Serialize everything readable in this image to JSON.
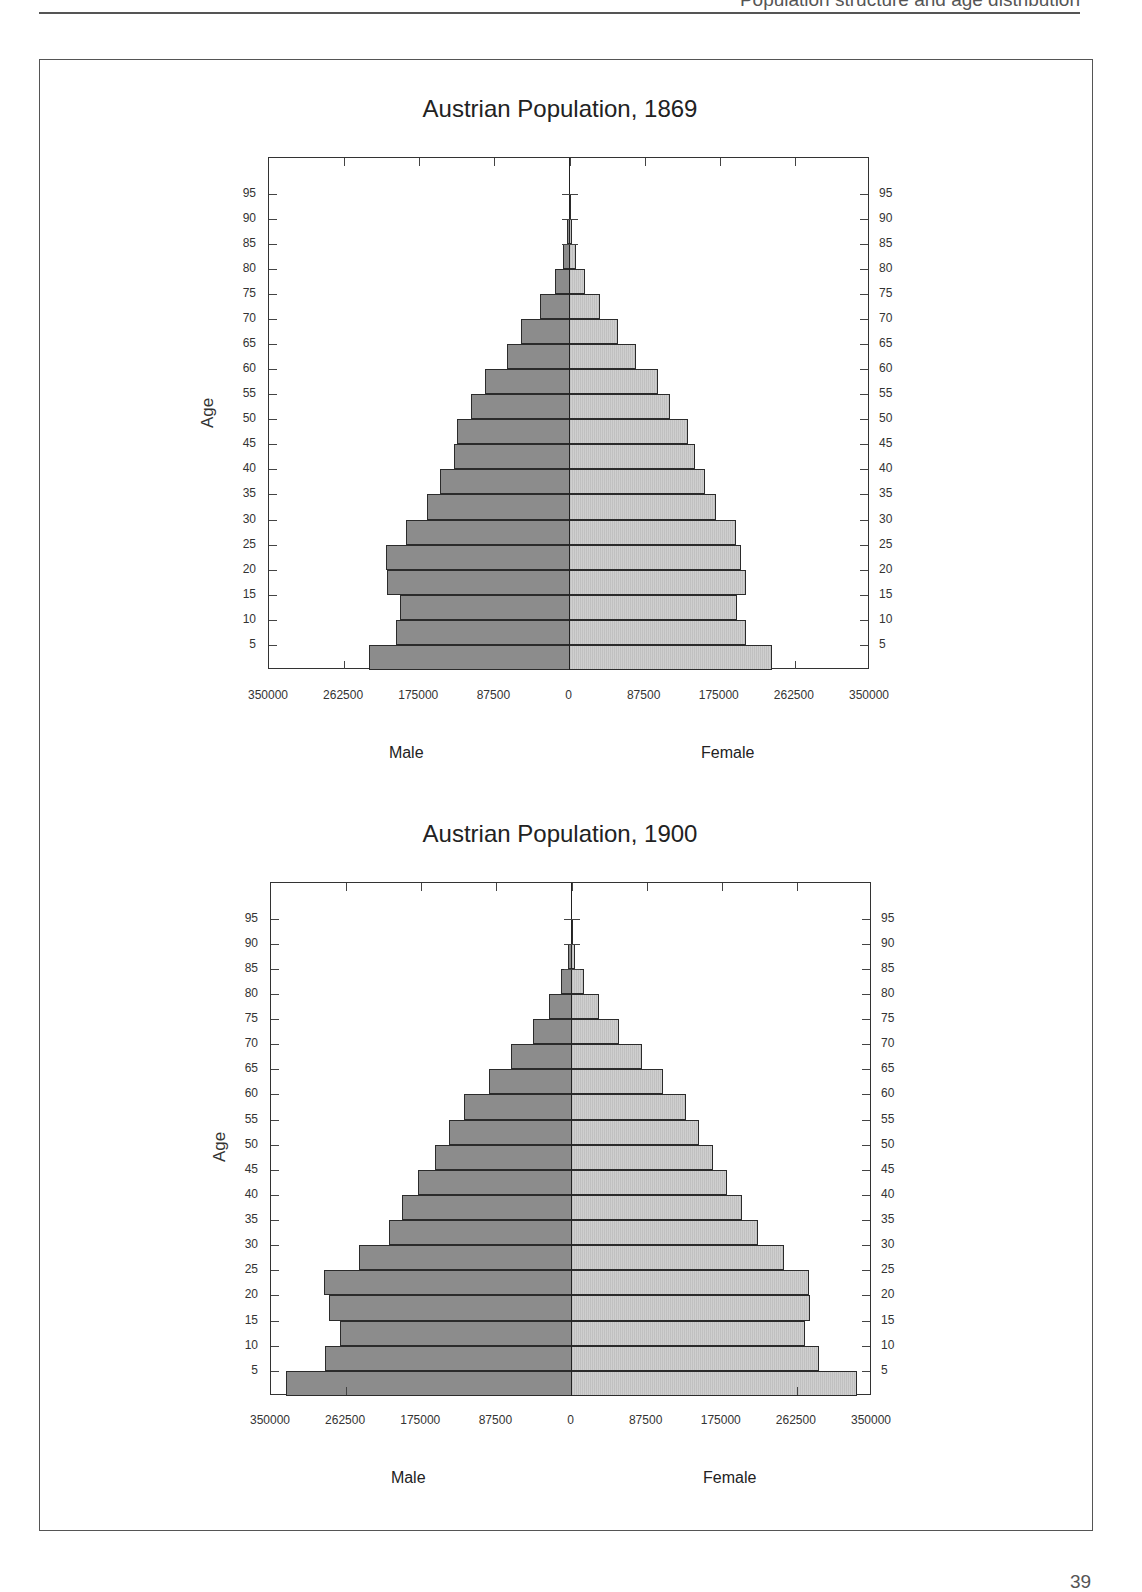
{
  "page": {
    "running_head": "Population structure and age distribution",
    "page_number": "39"
  },
  "chart_data": [
    {
      "type": "bar",
      "orientation": "horizontal",
      "subtype": "population-pyramid",
      "title": "Austrian Population, 1869",
      "ylabel": "Age",
      "xlabel_left": "Male",
      "xlabel_right": "Female",
      "xlim": [
        -350000,
        350000
      ],
      "x_ticks": [
        "350000",
        "262500",
        "175000",
        "87500",
        "0",
        "87500",
        "175000",
        "262500",
        "350000"
      ],
      "y_ticks": [
        5,
        10,
        15,
        20,
        25,
        30,
        35,
        40,
        45,
        50,
        55,
        60,
        65,
        70,
        75,
        80,
        85,
        90,
        95
      ],
      "categories": [
        "0-4",
        "5-9",
        "10-14",
        "15-19",
        "20-24",
        "25-29",
        "30-34",
        "35-39",
        "40-44",
        "45-49",
        "50-54",
        "55-59",
        "60-64",
        "65-69",
        "70-74",
        "75-79",
        "80-84",
        "85-89",
        "90-94"
      ],
      "series": [
        {
          "name": "Male",
          "values": [
            233000,
            202000,
            198000,
            213000,
            214000,
            191000,
            166000,
            151000,
            135000,
            131000,
            115000,
            99000,
            73000,
            56000,
            34000,
            17000,
            7000,
            3000,
            1000
          ]
        },
        {
          "name": "Female",
          "values": [
            236000,
            206000,
            195000,
            205000,
            200000,
            194000,
            171000,
            158000,
            146000,
            138000,
            117000,
            103000,
            78000,
            57000,
            35000,
            18000,
            7000,
            3000,
            1000
          ]
        }
      ],
      "grid": false
    },
    {
      "type": "bar",
      "orientation": "horizontal",
      "subtype": "population-pyramid",
      "title": "Austrian Population, 1900",
      "ylabel": "Age",
      "xlabel_left": "Male",
      "xlabel_right": "Female",
      "xlim": [
        -350000,
        350000
      ],
      "x_ticks": [
        "350000",
        "262500",
        "175000",
        "87500",
        "0",
        "87500",
        "175000",
        "262500",
        "350000"
      ],
      "y_ticks": [
        5,
        10,
        15,
        20,
        25,
        30,
        35,
        40,
        45,
        50,
        55,
        60,
        65,
        70,
        75,
        80,
        85,
        90,
        95
      ],
      "categories": [
        "0-4",
        "5-9",
        "10-14",
        "15-19",
        "20-24",
        "25-29",
        "30-34",
        "35-39",
        "40-44",
        "45-49",
        "50-54",
        "55-59",
        "60-64",
        "65-69",
        "70-74",
        "75-79",
        "80-84",
        "85-89",
        "90-94"
      ],
      "series": [
        {
          "name": "Male",
          "values": [
            332000,
            287000,
            270000,
            283000,
            288000,
            248000,
            213000,
            197000,
            179000,
            159000,
            143000,
            125000,
            96000,
            70000,
            45000,
            26000,
            12000,
            4000,
            1000
          ]
        },
        {
          "name": "Female",
          "values": [
            332000,
            288000,
            272000,
            278000,
            277000,
            248000,
            217000,
            199000,
            181000,
            165000,
            148000,
            133000,
            107000,
            82000,
            55000,
            32000,
            14000,
            4000,
            1000
          ]
        }
      ],
      "grid": false
    }
  ],
  "colors": {
    "male_fill": "#8c8c8c",
    "female_fill": "#cfcfcf",
    "outline": "#2b2b2b"
  }
}
